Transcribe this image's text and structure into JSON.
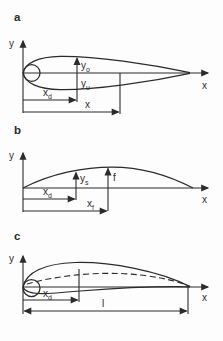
{
  "colors": {
    "ink": "#2b2b2b",
    "background": "#fdfdfd"
  },
  "panel_a": {
    "label": "a",
    "y_axis_label": "y",
    "x_axis_label": "x",
    "upper_ordinate": {
      "base": "y",
      "sub": "o"
    },
    "lower_ordinate": {
      "base": "y",
      "sub": "u"
    },
    "thickness_position": {
      "base": "x",
      "sub": "d"
    },
    "x_dimension": "x"
  },
  "panel_b": {
    "label": "b",
    "y_axis_label": "y",
    "x_axis_label": "x",
    "camber_ordinate": {
      "base": "y",
      "sub": "s"
    },
    "max_camber": "f",
    "thickness_position": {
      "base": "x",
      "sub": "d"
    },
    "camber_position": {
      "base": "x",
      "sub": "f"
    }
  },
  "panel_c": {
    "label": "c",
    "y_axis_label": "y",
    "x_axis_label": "x",
    "thickness_position": {
      "base": "x",
      "sub": "d"
    },
    "chord_length": "l"
  }
}
